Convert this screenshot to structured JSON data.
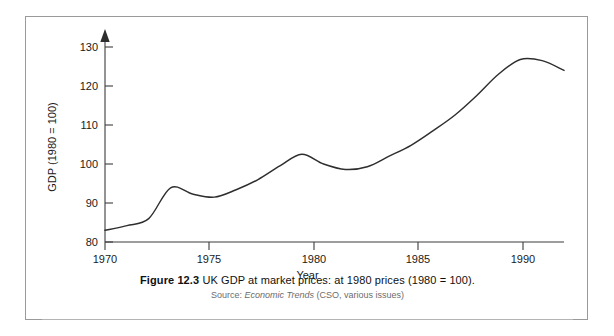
{
  "figure": {
    "caption_label": "Figure 12.3",
    "caption_text": "UK GDP at market prices: at 1980 prices (1980 = 100).",
    "source_prefix": "Source:",
    "source_italic": "Economic Trends",
    "source_suffix": "(CSO, various issues)"
  },
  "chart_data": {
    "type": "line",
    "title": "UK GDP at market prices: at 1980 prices (1980 = 100)",
    "xlabel": "Year",
    "ylabel": "GDP (1980 = 100)",
    "xlim": [
      1970,
      1991
    ],
    "ylim": [
      80,
      132
    ],
    "grid": false,
    "legend": "none",
    "xticks": [
      1970,
      1975,
      1980,
      1985,
      1990
    ],
    "xtick_labels": [
      "1970",
      "1975",
      "1980",
      "1985",
      "1990"
    ],
    "yticks": [
      80,
      90,
      100,
      110,
      120,
      130
    ],
    "ytick_labels": [
      "80",
      "90",
      "100",
      "110",
      "120",
      "130"
    ],
    "series": [
      {
        "name": "UK GDP index (1980 = 100)",
        "x": [
          1970,
          1971,
          1972,
          1973,
          1974,
          1975,
          1976,
          1977,
          1978,
          1979,
          1980,
          1981,
          1982,
          1983,
          1984,
          1985,
          1986,
          1987,
          1988,
          1989,
          1990,
          1991
        ],
        "values": [
          83.0,
          84.2,
          86.0,
          93.9,
          92.3,
          91.5,
          93.4,
          96.0,
          99.5,
          102.5,
          100.0,
          98.6,
          99.3,
          102.0,
          104.8,
          108.5,
          112.5,
          117.5,
          123.0,
          126.8,
          126.5,
          124.0
        ]
      }
    ]
  }
}
